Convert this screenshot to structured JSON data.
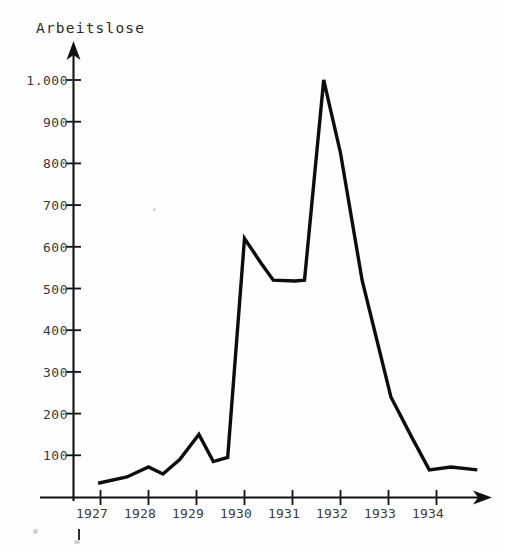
{
  "chart_data": {
    "type": "line",
    "title": "Arbeitslose",
    "xlabel": "",
    "ylabel": "Arbeitslose",
    "grid": false,
    "legend": false,
    "xlim": [
      1926.6,
      1935.1
    ],
    "ylim": [
      0,
      1060
    ],
    "y_ticks": [
      "100",
      "200",
      "300",
      "400",
      "500",
      "600",
      "700",
      "800",
      "900",
      "1.000"
    ],
    "y_tick_values": [
      100,
      200,
      300,
      400,
      500,
      600,
      700,
      800,
      900,
      1000
    ],
    "x_ticks": [
      "1927",
      "1928",
      "1929",
      "1930",
      "1931",
      "1932",
      "1933",
      "1934"
    ],
    "x_tick_values": [
      1927,
      1928,
      1929,
      1930,
      1931,
      1932,
      1933,
      1934
    ],
    "series": [
      {
        "name": "Arbeitslose",
        "x": [
          1926.95,
          1927.55,
          1928.0,
          1928.3,
          1928.65,
          1929.05,
          1929.35,
          1929.65,
          1930.0,
          1930.35,
          1930.6,
          1931.05,
          1931.25,
          1931.65,
          1932.0,
          1932.45,
          1933.05,
          1933.5,
          1933.85,
          1934.3,
          1934.85
        ],
        "y": [
          33,
          48,
          72,
          55,
          90,
          150,
          85,
          95,
          620,
          560,
          520,
          518,
          520,
          1000,
          825,
          520,
          240,
          140,
          65,
          72,
          65
        ],
        "color": "#0d0d0d"
      }
    ]
  },
  "axes": {
    "y_axis_name": "y-axis",
    "x_axis_name": "x-axis",
    "arrow_top": "up-arrow",
    "arrow_right": "right-arrow"
  }
}
